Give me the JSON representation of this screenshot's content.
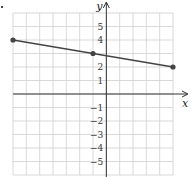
{
  "chart_data": {
    "type": "line",
    "title": "",
    "xlabel": "x",
    "ylabel": "y",
    "xlim": [
      -7,
      5
    ],
    "ylim": [
      -6,
      6
    ],
    "grid": true,
    "y_tick_labels": [
      "5",
      "4",
      "2",
      "1",
      "−1",
      "−2",
      "−3",
      "−4",
      "−5"
    ],
    "y_tick_values": [
      5,
      4,
      2,
      1,
      -1,
      -2,
      -3,
      -4,
      -5
    ],
    "series": [
      {
        "name": "line",
        "points": [
          {
            "x": -7,
            "y": 4
          },
          {
            "x": -1,
            "y": 3
          },
          {
            "x": 5,
            "y": 2
          }
        ]
      }
    ],
    "colors": {
      "grid": "#cfcfcf",
      "axis": "#333333",
      "line": "#444444"
    }
  }
}
